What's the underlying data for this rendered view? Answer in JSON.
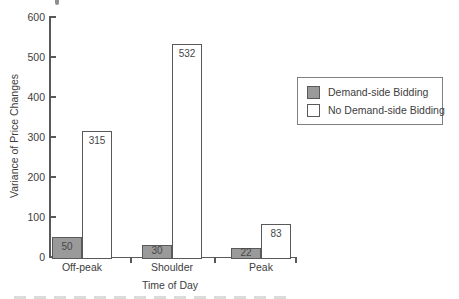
{
  "chart_data": {
    "type": "bar",
    "title": "",
    "categories": [
      "Off-peak",
      "Shoulder",
      "Peak"
    ],
    "series": [
      {
        "name": "Demand-side Bidding",
        "values": [
          50,
          30,
          22
        ],
        "fill": "#9a9a9a"
      },
      {
        "name": "No Demand-side Bidding",
        "values": [
          315,
          532,
          83
        ],
        "fill": "#ffffff"
      }
    ],
    "bar_value_labels": [
      [
        50,
        30,
        22
      ],
      [
        315,
        532,
        83
      ]
    ],
    "xlabel": "Time of Day",
    "ylabel": "Variance of Price Changes",
    "ylim": [
      0,
      600
    ],
    "yticks": [
      0,
      100,
      200,
      300,
      400,
      500,
      600
    ],
    "grid": false,
    "legend_position": "right",
    "bar_labels_shown": true
  },
  "colors": {
    "series_fill_demand": "#9a9a9a",
    "series_fill_no_demand": "#ffffff",
    "bar_border": "#595959",
    "axis": "#595959",
    "text": "#404040",
    "legend_border": "#808080"
  }
}
